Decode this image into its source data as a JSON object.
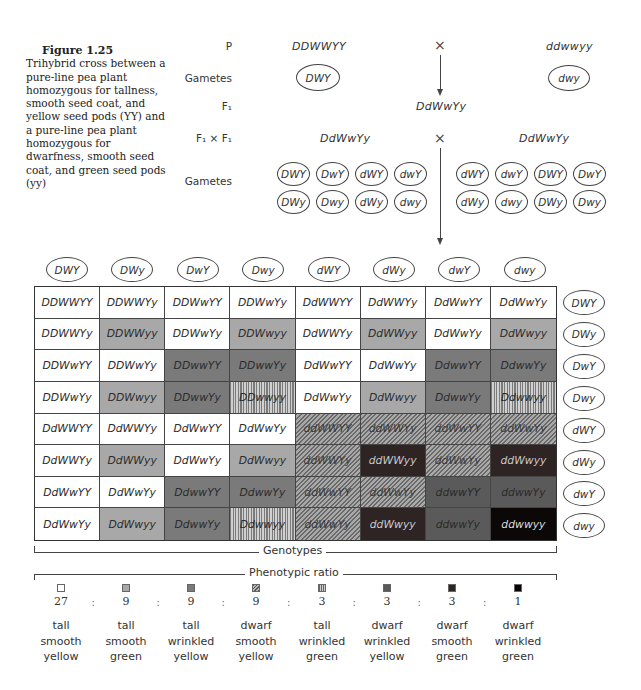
{
  "caption": {
    "figure_label": "Figure 1.25",
    "text": "Trihybrid cross between a pure-line pea plant homozygous for tallness, smooth seed coat, and yellow seed pods (YY) and a pure-line pea plant homozygous for dwarfness, smooth seed coat, and green seed pods (yy)"
  },
  "cross": {
    "row_labels": {
      "p": "P",
      "gametes1": "Gametes",
      "f1": "F₁",
      "f1xf1": "F₁ × F₁",
      "gametes2": "Gametes"
    },
    "parent1": "DDWWYY",
    "parent2": "ddwwyy",
    "cross_symbol": "×",
    "parent1_gamete": "DWY",
    "parent2_gamete": "dwy",
    "f1_genotype": "DdWwYy",
    "f1_left": "DdWwYy",
    "f1_right": "DdWwYy",
    "left_gametes": [
      "DWY",
      "DwY",
      "dWY",
      "dwY",
      "DWy",
      "Dwy",
      "dWy",
      "dwy"
    ],
    "right_gametes": [
      "dWY",
      "dwY",
      "DWY",
      "DwY",
      "dWy",
      "dwy",
      "DWy",
      "Dwy"
    ]
  },
  "punnett": {
    "column_gametes": [
      "DWY",
      "DWy",
      "DwY",
      "Dwy",
      "dWY",
      "dWy",
      "dwY",
      "dwy"
    ],
    "row_gametes": [
      "DWY",
      "DWy",
      "DwY",
      "Dwy",
      "dWY",
      "dWy",
      "dwY",
      "dwy"
    ],
    "rows": [
      [
        [
          "DDWWYY",
          "tsy"
        ],
        [
          "DDWWYy",
          "tsy"
        ],
        [
          "DDWwYY",
          "tsy"
        ],
        [
          "DDWwYy",
          "tsy"
        ],
        [
          "DdWWYY",
          "tsy"
        ],
        [
          "DdWWYy",
          "tsy"
        ],
        [
          "DdWwYY",
          "tsy"
        ],
        [
          "DdWwYy",
          "tsy"
        ]
      ],
      [
        [
          "DDWWYy",
          "tsy"
        ],
        [
          "DDWWyy",
          "tsg"
        ],
        [
          "DDWwYy",
          "tsy"
        ],
        [
          "DDWwyy",
          "tsg"
        ],
        [
          "DdWWYy",
          "tsy"
        ],
        [
          "DdWWyy",
          "tsg"
        ],
        [
          "DdWwYy",
          "tsy"
        ],
        [
          "DdWwyy",
          "tsg"
        ]
      ],
      [
        [
          "DDWwYY",
          "tsy"
        ],
        [
          "DDWwYy",
          "tsy"
        ],
        [
          "DDwwYY",
          "twy"
        ],
        [
          "DDwwYy",
          "twy"
        ],
        [
          "DdWwYY",
          "tsy"
        ],
        [
          "DdWwYy",
          "tsy"
        ],
        [
          "DdwwYY",
          "twy"
        ],
        [
          "DdwwYy",
          "twy"
        ]
      ],
      [
        [
          "DDWwYy",
          "tsy"
        ],
        [
          "DDWwyy",
          "tsg"
        ],
        [
          "DDwwYy",
          "twy"
        ],
        [
          "DDwwyy",
          "twg"
        ],
        [
          "DdWwYy",
          "tsy"
        ],
        [
          "DdWwyy",
          "tsg"
        ],
        [
          "DdwwYy",
          "twy"
        ],
        [
          "Ddwwyy",
          "twg"
        ]
      ],
      [
        [
          "DdWWYY",
          "tsy"
        ],
        [
          "DdWWYy",
          "tsy"
        ],
        [
          "DdWwYY",
          "tsy"
        ],
        [
          "DdWwYy",
          "tsy"
        ],
        [
          "ddWWYY",
          "dsy"
        ],
        [
          "ddWWYy",
          "dsy"
        ],
        [
          "ddWwYY",
          "dsy"
        ],
        [
          "ddWwYy",
          "dsy"
        ]
      ],
      [
        [
          "DdWWYy",
          "tsy"
        ],
        [
          "DdWWyy",
          "tsg"
        ],
        [
          "DdWwYy",
          "tsy"
        ],
        [
          "DdWwyy",
          "tsg"
        ],
        [
          "ddWWYy",
          "dsy"
        ],
        [
          "ddWWyy",
          "dsg"
        ],
        [
          "ddWwYy",
          "dsy"
        ],
        [
          "ddWwyy",
          "dsg"
        ]
      ],
      [
        [
          "DdWwYY",
          "tsy"
        ],
        [
          "DdWwYy",
          "tsy"
        ],
        [
          "DdwwYY",
          "twy"
        ],
        [
          "DdwwYy",
          "twy"
        ],
        [
          "ddWwYY",
          "dsy"
        ],
        [
          "ddWwYy",
          "dsy"
        ],
        [
          "ddwwYY",
          "dwy"
        ],
        [
          "ddwwYy",
          "dwy"
        ]
      ],
      [
        [
          "DdWwYy",
          "tsy"
        ],
        [
          "DdWwyy",
          "tsg"
        ],
        [
          "DdwwYy",
          "twy"
        ],
        [
          "Ddwwyy",
          "twg"
        ],
        [
          "ddWwYy",
          "dsy"
        ],
        [
          "ddWwyy",
          "dsg"
        ],
        [
          "ddwwYy",
          "dwy"
        ],
        [
          "ddwwyy",
          "dwg"
        ]
      ]
    ]
  },
  "labels": {
    "genotypes": "Genotypes",
    "phenotypic_ratio": "Phenotypic ratio",
    "ratio_separator": ":"
  },
  "phenotypes": [
    {
      "key": "tsy",
      "ratio": "27",
      "height": "tall",
      "seed": "smooth",
      "pod": "yellow",
      "swatch": "white"
    },
    {
      "key": "tsg",
      "ratio": "9",
      "height": "tall",
      "seed": "smooth",
      "pod": "green",
      "swatch": "light-gray"
    },
    {
      "key": "twy",
      "ratio": "9",
      "height": "tall",
      "seed": "wrinkled",
      "pod": "yellow",
      "swatch": "medium-gray"
    },
    {
      "key": "dsy",
      "ratio": "9",
      "height": "dwarf",
      "seed": "smooth",
      "pod": "yellow",
      "swatch": "diagonal-hatch"
    },
    {
      "key": "twg",
      "ratio": "3",
      "height": "tall",
      "seed": "wrinkled",
      "pod": "green",
      "swatch": "vertical-stripes"
    },
    {
      "key": "dwy",
      "ratio": "3",
      "height": "dwarf",
      "seed": "wrinkled",
      "pod": "yellow",
      "swatch": "dark-gray"
    },
    {
      "key": "dsg",
      "ratio": "3",
      "height": "dwarf",
      "seed": "smooth",
      "pod": "green",
      "swatch": "very-dark-gray"
    },
    {
      "key": "dwg",
      "ratio": "1",
      "height": "dwarf",
      "seed": "wrinkled",
      "pod": "green",
      "swatch": "black"
    }
  ]
}
